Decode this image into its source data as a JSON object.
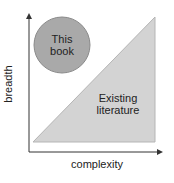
{
  "diagram": {
    "circle_label_line1": "This",
    "circle_label_line2": "book",
    "triangle_label_line1": "Existing",
    "triangle_label_line2": "literature",
    "x_axis_label": "complexity",
    "y_axis_label": "breadth",
    "colors": {
      "circle_fill": "#a9a9a9",
      "circle_stroke": "#8a8a8a",
      "triangle_fill": "#d3d3d3",
      "triangle_stroke": "#b5b5b5",
      "axis": "#333333"
    }
  }
}
